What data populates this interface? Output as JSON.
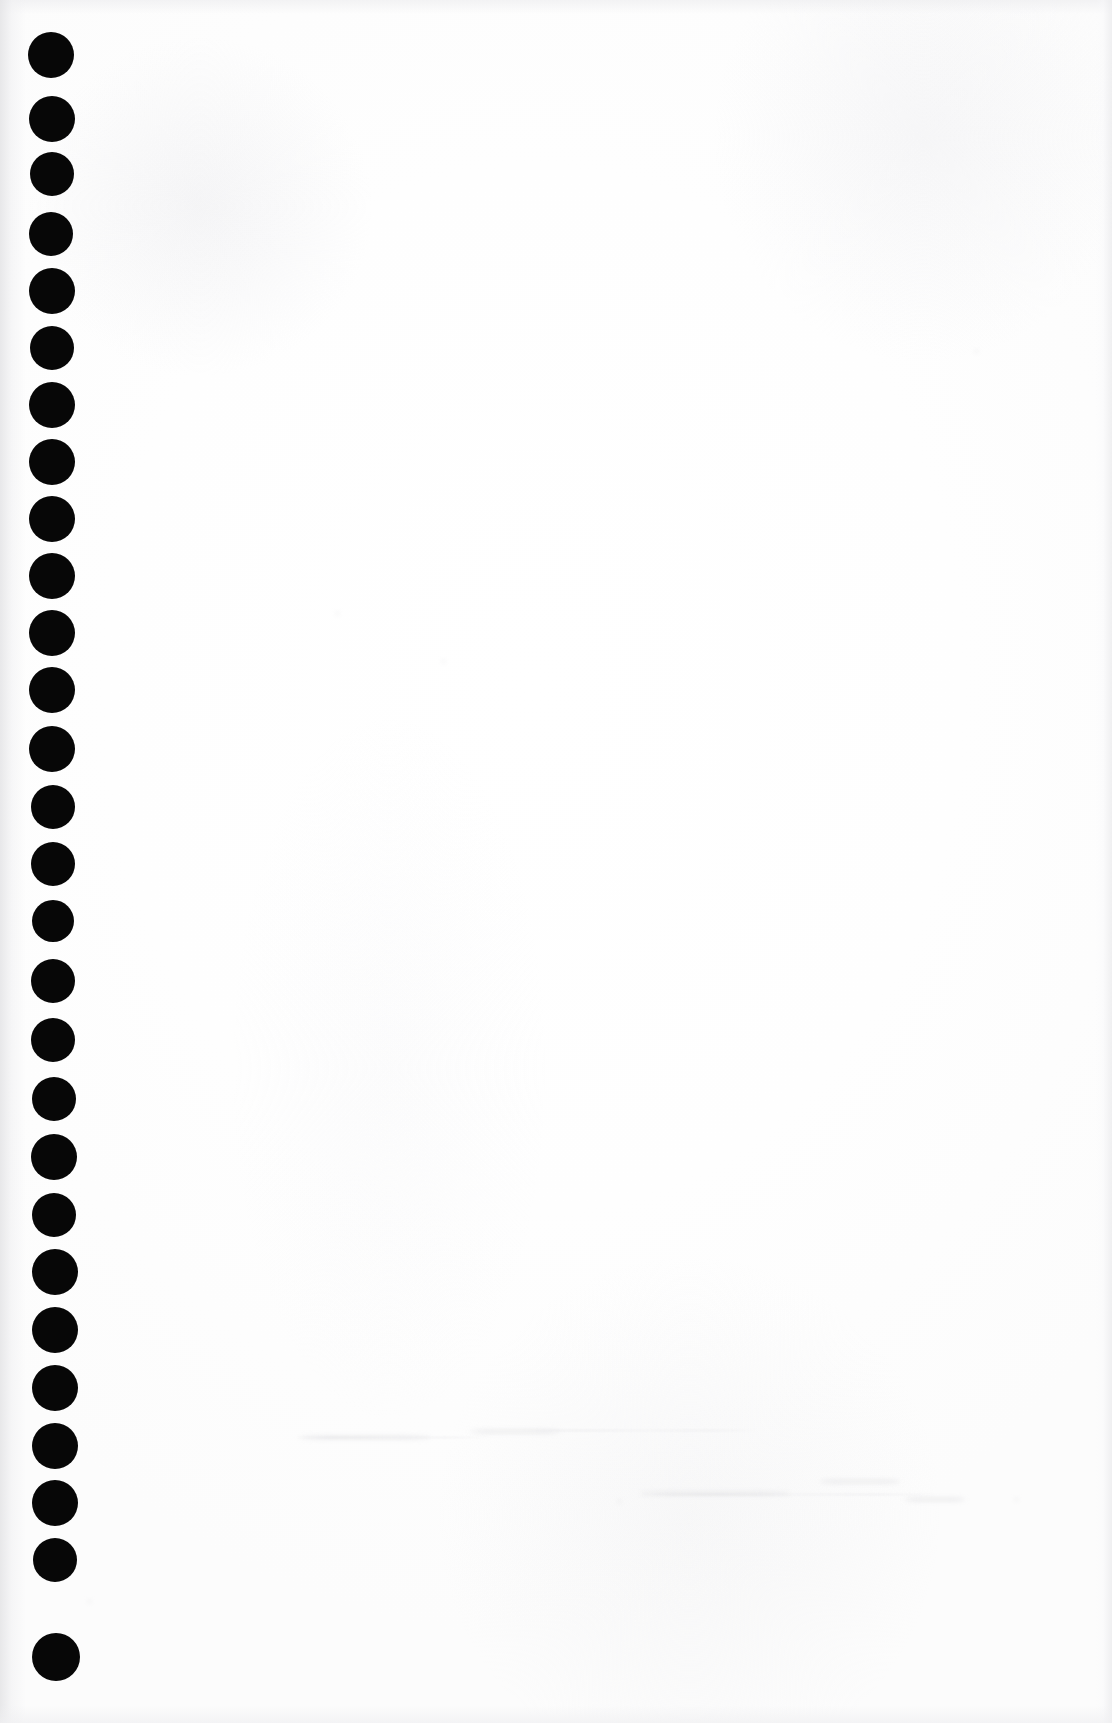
{
  "document": {
    "kind": "scanned-page",
    "description": "Blank scanned document page with a vertical column of punched binding dots down the left margin",
    "page_width": 1112,
    "page_height": 1723,
    "background_color": "#ffffff",
    "paper_tone": "#fdfdfd",
    "has_visible_text": false,
    "body_text": ""
  },
  "margin_dots": {
    "name": "left-margin-dot-column",
    "count": 26,
    "color": "#070707",
    "diameter": 46,
    "center_x": 52,
    "first_center_y": 55,
    "spacing_y": 64,
    "shape": "circle",
    "dots": [
      {
        "index": 1,
        "cx": 51,
        "cy": 55,
        "r": 23
      },
      {
        "index": 2,
        "cx": 52,
        "cy": 119,
        "r": 23
      },
      {
        "index": 3,
        "cx": 52,
        "cy": 174,
        "r": 22
      },
      {
        "index": 4,
        "cx": 51,
        "cy": 234,
        "r": 22
      },
      {
        "index": 5,
        "cx": 52,
        "cy": 291,
        "r": 23
      },
      {
        "index": 6,
        "cx": 52,
        "cy": 348,
        "r": 22
      },
      {
        "index": 7,
        "cx": 52,
        "cy": 405,
        "r": 23
      },
      {
        "index": 8,
        "cx": 52,
        "cy": 462,
        "r": 23
      },
      {
        "index": 9,
        "cx": 52,
        "cy": 519,
        "r": 23
      },
      {
        "index": 10,
        "cx": 52,
        "cy": 576,
        "r": 23
      },
      {
        "index": 11,
        "cx": 52,
        "cy": 633,
        "r": 23
      },
      {
        "index": 12,
        "cx": 52,
        "cy": 690,
        "r": 23
      },
      {
        "index": 13,
        "cx": 52,
        "cy": 749,
        "r": 23
      },
      {
        "index": 14,
        "cx": 53,
        "cy": 807,
        "r": 22
      },
      {
        "index": 15,
        "cx": 53,
        "cy": 864,
        "r": 22
      },
      {
        "index": 16,
        "cx": 53,
        "cy": 921,
        "r": 21
      },
      {
        "index": 17,
        "cx": 53,
        "cy": 981,
        "r": 22
      },
      {
        "index": 18,
        "cx": 53,
        "cy": 1040,
        "r": 22
      },
      {
        "index": 19,
        "cx": 54,
        "cy": 1099,
        "r": 22
      },
      {
        "index": 20,
        "cx": 54,
        "cy": 1157,
        "r": 23
      },
      {
        "index": 21,
        "cx": 54,
        "cy": 1215,
        "r": 22
      },
      {
        "index": 22,
        "cx": 55,
        "cy": 1272,
        "r": 23
      },
      {
        "index": 23,
        "cx": 55,
        "cy": 1330,
        "r": 23
      },
      {
        "index": 24,
        "cx": 55,
        "cy": 1388,
        "r": 23
      },
      {
        "index": 25,
        "cx": 55,
        "cy": 1446,
        "r": 23
      },
      {
        "index": 26,
        "cx": 55,
        "cy": 1503,
        "r": 23
      },
      {
        "index": 27,
        "cx": 55,
        "cy": 1560,
        "r": 22
      },
      {
        "index": 28,
        "cx": 56,
        "cy": 1657,
        "r": 24
      }
    ]
  },
  "scan_artifacts": {
    "left_gutter_shadow": true,
    "right_edge_shadow": true,
    "top_edge_shadow": true,
    "bottom_edge_shadow": true,
    "ghost_marks": [
      {
        "x": 300,
        "y": 1436,
        "w": 130,
        "h": 3
      },
      {
        "x": 470,
        "y": 1430,
        "w": 90,
        "h": 3
      },
      {
        "x": 640,
        "y": 1492,
        "w": 150,
        "h": 3
      },
      {
        "x": 820,
        "y": 1480,
        "w": 80,
        "h": 3
      },
      {
        "x": 905,
        "y": 1498,
        "w": 60,
        "h": 3
      }
    ],
    "ghost_streaks": [
      {
        "x": 290,
        "y": 1437,
        "w": 200
      },
      {
        "x": 520,
        "y": 1430,
        "w": 240
      },
      {
        "x": 640,
        "y": 1494,
        "w": 300
      }
    ],
    "speckles": [
      {
        "x": 88,
        "y": 1600,
        "w": 3,
        "h": 3
      },
      {
        "x": 336,
        "y": 612,
        "w": 3,
        "h": 3
      },
      {
        "x": 442,
        "y": 660,
        "w": 3,
        "h": 3
      },
      {
        "x": 975,
        "y": 350,
        "w": 3,
        "h": 3
      },
      {
        "x": 1015,
        "y": 1498,
        "w": 3,
        "h": 3
      },
      {
        "x": 618,
        "y": 1500,
        "w": 3,
        "h": 3
      }
    ]
  }
}
